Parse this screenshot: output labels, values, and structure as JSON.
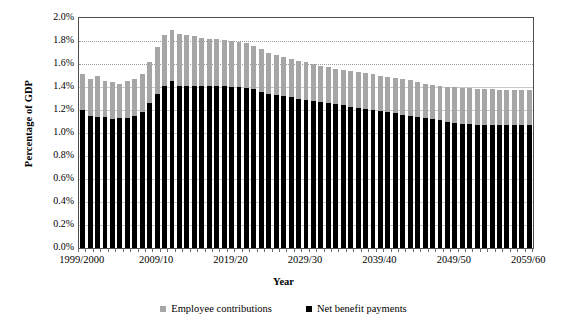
{
  "chart_data": {
    "type": "bar",
    "stacked": false,
    "title": "",
    "xlabel": "Year",
    "ylabel": "Percentage of GDP",
    "ylim": [
      0.0,
      2.0
    ],
    "ytick_labels": [
      "0.0%",
      "0.2%",
      "0.4%",
      "0.6%",
      "0.8%",
      "1.0%",
      "1.2%",
      "1.4%",
      "1.6%",
      "1.8%",
      "2.0%"
    ],
    "ytick_values": [
      0.0,
      0.2,
      0.4,
      0.6,
      0.8,
      1.0,
      1.2,
      1.4,
      1.6,
      1.8,
      2.0
    ],
    "grid": true,
    "legend_position": "bottom",
    "x_tick_labels": [
      "1999/2000",
      "2009/10",
      "2019/20",
      "2029/30",
      "2039/40",
      "2049/50",
      "2059/60"
    ],
    "x_tick_indices": [
      0,
      10,
      20,
      30,
      40,
      50,
      60
    ],
    "categories": [
      "1999/2000",
      "2000/01",
      "2001/02",
      "2002/03",
      "2003/04",
      "2004/05",
      "2005/06",
      "2006/07",
      "2007/08",
      "2008/09",
      "2009/10",
      "2010/11",
      "2011/12",
      "2012/13",
      "2013/14",
      "2014/15",
      "2015/16",
      "2016/17",
      "2017/18",
      "2018/19",
      "2019/20",
      "2020/21",
      "2021/22",
      "2022/23",
      "2023/24",
      "2024/25",
      "2025/26",
      "2026/27",
      "2027/28",
      "2028/29",
      "2029/30",
      "2030/31",
      "2031/32",
      "2032/33",
      "2033/34",
      "2034/35",
      "2035/36",
      "2036/37",
      "2037/38",
      "2038/39",
      "2039/40",
      "2040/41",
      "2041/42",
      "2042/43",
      "2043/44",
      "2044/45",
      "2045/46",
      "2046/47",
      "2047/48",
      "2048/49",
      "2049/50",
      "2050/51",
      "2051/52",
      "2052/53",
      "2053/54",
      "2054/55",
      "2055/56",
      "2056/57",
      "2057/58",
      "2058/59",
      "2059/60"
    ],
    "series": [
      {
        "name": "Employee contributions",
        "color": "#a6a6a6",
        "values": [
          1.51,
          1.47,
          1.5,
          1.45,
          1.44,
          1.43,
          1.45,
          1.47,
          1.51,
          1.62,
          1.75,
          1.85,
          1.9,
          1.86,
          1.85,
          1.84,
          1.83,
          1.82,
          1.82,
          1.81,
          1.8,
          1.79,
          1.78,
          1.76,
          1.73,
          1.7,
          1.68,
          1.66,
          1.64,
          1.63,
          1.62,
          1.6,
          1.58,
          1.57,
          1.56,
          1.55,
          1.54,
          1.53,
          1.52,
          1.51,
          1.5,
          1.49,
          1.48,
          1.47,
          1.46,
          1.44,
          1.43,
          1.42,
          1.41,
          1.4,
          1.4,
          1.39,
          1.39,
          1.38,
          1.38,
          1.38,
          1.37,
          1.37,
          1.37,
          1.37,
          1.37
        ]
      },
      {
        "name": "Net benefit payments",
        "color": "#000000",
        "values": [
          1.2,
          1.15,
          1.14,
          1.14,
          1.12,
          1.13,
          1.13,
          1.15,
          1.18,
          1.26,
          1.34,
          1.41,
          1.45,
          1.41,
          1.41,
          1.41,
          1.41,
          1.41,
          1.41,
          1.41,
          1.4,
          1.4,
          1.39,
          1.38,
          1.36,
          1.34,
          1.33,
          1.32,
          1.31,
          1.3,
          1.29,
          1.28,
          1.27,
          1.26,
          1.25,
          1.24,
          1.23,
          1.22,
          1.21,
          1.2,
          1.19,
          1.18,
          1.17,
          1.16,
          1.15,
          1.14,
          1.13,
          1.12,
          1.11,
          1.1,
          1.09,
          1.08,
          1.08,
          1.07,
          1.07,
          1.07,
          1.07,
          1.07,
          1.07,
          1.07,
          1.07
        ]
      }
    ]
  },
  "legend": {
    "items": [
      {
        "label": "Employee contributions",
        "color": "#a6a6a6"
      },
      {
        "label": "Net benefit payments",
        "color": "#000000"
      }
    ]
  },
  "axes": {
    "y_title": "Percentage of GDP",
    "x_title": "Year"
  }
}
